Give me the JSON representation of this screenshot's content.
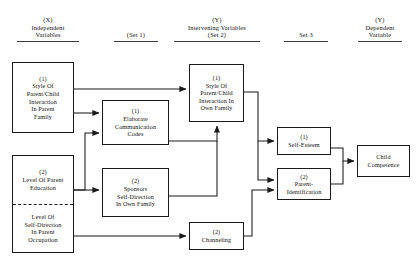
{
  "diagram": {
    "columns": [
      {
        "id": "col-x",
        "line1": "(X)",
        "line2": "Independent",
        "line3": "Variables"
      },
      {
        "id": "col-set1",
        "line1": "",
        "line2": "(Set 1)",
        "line3": ""
      },
      {
        "id": "col-y-set2",
        "line1": "(Y)",
        "line2": "Intervening Variables",
        "line3": "(Set 2)"
      },
      {
        "id": "col-set3",
        "line1": "",
        "line2": "Set 3",
        "line3": ""
      },
      {
        "id": "col-y-dep",
        "line1": "(Y)",
        "line2": "Dependent",
        "line3": "Variable"
      }
    ],
    "nodes": [
      {
        "id": "style-parent-family",
        "num": "(1)",
        "title": "Style Of\nParent/Child\nInteraction\nIn Parent\nFamily"
      },
      {
        "id": "parent-education",
        "num": "(2)",
        "title": "Level Of Parent\nEducation"
      },
      {
        "id": "self-direction-occupation",
        "num": "",
        "title": "Level Of\nSelf-Direction\nIn Parent\nOccupation"
      },
      {
        "id": "elaborate-codes",
        "num": "(1)",
        "title": "Elaborate\nCommunication\nCodes"
      },
      {
        "id": "sponsors-self-direction",
        "num": "(2)",
        "title": "Sponsors\nSelf-Direction\nIn Own Family"
      },
      {
        "id": "style-own-family",
        "num": "(1)",
        "title": "Style Of\nParent/Child\nInteraction In\nOwn Family"
      },
      {
        "id": "channeling",
        "num": "(2)",
        "title": "Channeling"
      },
      {
        "id": "self-esteem",
        "num": "(1)",
        "title": "Self-Esteem"
      },
      {
        "id": "parent-identification",
        "num": "(2)",
        "title": "Parent-\nIdentification"
      },
      {
        "id": "child-competence",
        "num": "",
        "title": "Child\nCompetence"
      }
    ],
    "colors": {
      "stroke": "#1a1a1a",
      "background": "#ffffff",
      "text": "#101010",
      "rule": "#3a3a3a"
    }
  }
}
